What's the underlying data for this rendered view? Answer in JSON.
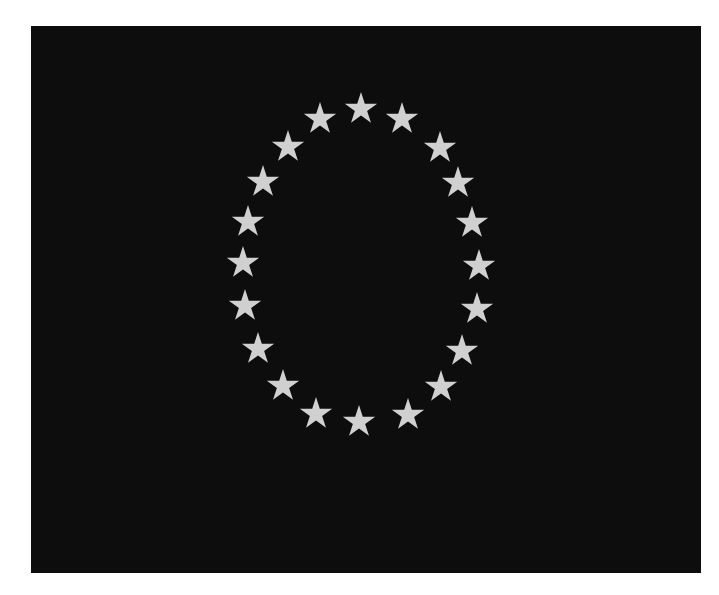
{
  "image": {
    "description": "Black flag with twenty light gray five-pointed stars arranged in an oval ring",
    "background_color": "#ffffff",
    "flag": {
      "x": 31,
      "y": 26,
      "width": 670,
      "height": 547,
      "color": "#0d0d0d"
    },
    "star_color": "#d0d0d0",
    "star_radius": 17,
    "star_count": 20,
    "stars": [
      {
        "x": 361,
        "y": 109
      },
      {
        "x": 402,
        "y": 119
      },
      {
        "x": 440,
        "y": 148
      },
      {
        "x": 458,
        "y": 183
      },
      {
        "x": 472,
        "y": 223
      },
      {
        "x": 479,
        "y": 266
      },
      {
        "x": 477,
        "y": 309
      },
      {
        "x": 462,
        "y": 351
      },
      {
        "x": 441,
        "y": 387
      },
      {
        "x": 408,
        "y": 415
      },
      {
        "x": 359,
        "y": 422
      },
      {
        "x": 316,
        "y": 414
      },
      {
        "x": 283,
        "y": 386
      },
      {
        "x": 258,
        "y": 349
      },
      {
        "x": 245,
        "y": 306
      },
      {
        "x": 243,
        "y": 263
      },
      {
        "x": 248,
        "y": 222
      },
      {
        "x": 263,
        "y": 182
      },
      {
        "x": 288,
        "y": 147
      },
      {
        "x": 320,
        "y": 119
      }
    ]
  }
}
